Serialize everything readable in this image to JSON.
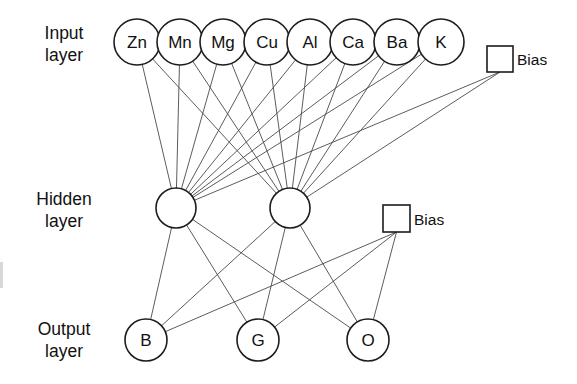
{
  "diagram": {
    "type": "neural-network",
    "background_color": "#ffffff",
    "edge_color": "#4a4a4a",
    "node_stroke_color": "#1c1c1c",
    "node_fill_color": "#ffffff",
    "text_color": "#111111"
  },
  "labels": {
    "input": "Input\nlayer",
    "hidden": "Hidden\nlayer",
    "output": "Output\nlayer"
  },
  "layers": {
    "input": {
      "name": "Input layer",
      "node_radius": 23,
      "center_y": 42,
      "nodes": [
        {
          "label": "Zn",
          "cx": 137,
          "cy": 42
        },
        {
          "label": "Mn",
          "cx": 180,
          "cy": 42
        },
        {
          "label": "Mg",
          "cx": 223,
          "cy": 42
        },
        {
          "label": "Cu",
          "cx": 267,
          "cy": 42
        },
        {
          "label": "Al",
          "cx": 310,
          "cy": 42
        },
        {
          "label": "Ca",
          "cx": 353,
          "cy": 42
        },
        {
          "label": "Ba",
          "cx": 397,
          "cy": 42
        },
        {
          "label": "K",
          "cx": 441,
          "cy": 42
        }
      ],
      "bias": {
        "label": "Bias",
        "x": 487,
        "y": 46,
        "size": 26,
        "label_x": 517,
        "label_y": 59
      }
    },
    "hidden": {
      "name": "Hidden layer",
      "node_radius": 20,
      "center_y": 208,
      "nodes": [
        {
          "label": "",
          "cx": 176,
          "cy": 208
        },
        {
          "label": "",
          "cx": 290,
          "cy": 208
        }
      ],
      "bias": {
        "label": "Bias",
        "x": 383,
        "y": 205,
        "size": 27,
        "label_x": 414,
        "label_y": 219
      }
    },
    "output": {
      "name": "Output layer",
      "node_radius": 21,
      "center_y": 340,
      "nodes": [
        {
          "label": "B",
          "cx": 146,
          "cy": 340
        },
        {
          "label": "G",
          "cx": 258,
          "cy": 340
        },
        {
          "label": "O",
          "cx": 368,
          "cy": 340
        }
      ]
    }
  },
  "connections": {
    "input_to_hidden": "fully-connected (8 inputs + 1 bias to 2 hidden nodes)",
    "hidden_to_output": "fully-connected (2 hidden nodes + 1 bias to 3 outputs)",
    "input_to_hidden_count": 18,
    "hidden_to_output_count": 9
  }
}
